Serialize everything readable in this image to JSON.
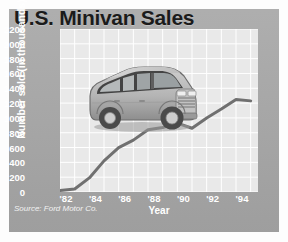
{
  "figure": {
    "title": "U.S. Minivan Sales",
    "source": "Source: Ford Motor Co.",
    "colors": {
      "panel": "#a8a8a8",
      "plot_background": "#e9e9e9",
      "gridline": "#ffffff",
      "line": "#707070",
      "title_text": "#1b1b1b",
      "axis_text": "#ffffff",
      "van_body": "#b9b9b9"
    },
    "illustration": {
      "name": "minivan-illustration",
      "description": "grey minivan three-quarter front view"
    }
  },
  "chart_data": {
    "type": "line",
    "title": "U.S. Minivan Sales",
    "xlabel": "Year",
    "ylabel": "Number sold (in thousands)",
    "ylim": [
      0,
      2200
    ],
    "xlim": [
      1982,
      1995.5
    ],
    "ytick_labels": [
      "0",
      "200",
      "400",
      "600",
      "800",
      "1000",
      "1200",
      "1400",
      "1600",
      "1800",
      "2000",
      "2200"
    ],
    "yticks": [
      0,
      200,
      400,
      600,
      800,
      1000,
      1200,
      1400,
      1600,
      1800,
      2000,
      2200
    ],
    "xtick_labels": [
      "'82",
      "'84",
      "'86",
      "'88",
      "'90",
      "'92",
      "'94"
    ],
    "xticks": [
      1982,
      1984,
      1986,
      1988,
      1990,
      1992,
      1994
    ],
    "grid": true,
    "legend": "none",
    "x": [
      1982,
      1983,
      1984,
      1985,
      1986,
      1987,
      1988,
      1989,
      1990,
      1991,
      1992,
      1993,
      1994,
      1995
    ],
    "values": [
      20,
      40,
      190,
      420,
      600,
      700,
      840,
      870,
      930,
      860,
      1000,
      1120,
      1250,
      1230
    ],
    "series": [
      {
        "name": "Minivans sold",
        "values": [
          20,
          40,
          190,
          420,
          600,
          700,
          840,
          870,
          930,
          860,
          1000,
          1120,
          1250,
          1230
        ]
      }
    ]
  }
}
